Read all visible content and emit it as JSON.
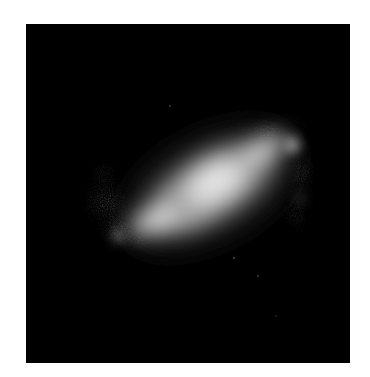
{
  "image": {
    "subject": "barred spiral galaxy",
    "description": "Grayscale astronomical image of a barred spiral galaxy on a black background, with a bright elongated central bar oriented from lower-left to upper-right, faint curved spiral arms, and a bright knot near the upper-right end of the bar.",
    "colors": {
      "page_background": "#ffffff",
      "sky_background": "#000000",
      "core": "#e6e6e6",
      "arms": "#8a8a8a"
    }
  }
}
